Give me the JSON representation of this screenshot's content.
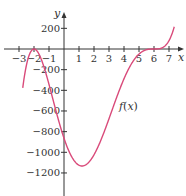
{
  "chart_data": {
    "type": "line",
    "title": "",
    "xlabel": "x",
    "ylabel": "y",
    "xlim": [
      -3.6,
      7.9
    ],
    "ylim": [
      -1420,
      470
    ],
    "x_ticks": [
      -3,
      -2,
      -1,
      1,
      2,
      3,
      4,
      5,
      6,
      7
    ],
    "y_ticks": [
      200,
      -200,
      -400,
      -600,
      -800,
      -1000,
      -1200
    ],
    "grid": false,
    "legend": null,
    "annotations": [
      {
        "text": "f(x)",
        "x": 4.0,
        "y": -560
      }
    ],
    "series": [
      {
        "name": "f(x)",
        "color": "#d94a7a",
        "x": [
          -2.7,
          -2.5,
          -2.0,
          -1.5,
          -1.0,
          0.0,
          1.0,
          1.2,
          2.0,
          3.0,
          4.0,
          5.0,
          5.5,
          6.0,
          6.5,
          7.0,
          7.3
        ],
        "y": [
          -1688,
          -416,
          0,
          -421,
          -1029,
          -864,
          -1125,
          -1132,
          -1024,
          -675,
          -288,
          -49,
          -3,
          0,
          1,
          81,
          226
        ]
      }
    ],
    "key_points": {
      "local_max": [
        -2,
        0
      ],
      "local_min": [
        1.2,
        -1132
      ],
      "y_intercept": [
        0,
        -864
      ],
      "zero_inflection": [
        6,
        0
      ]
    }
  },
  "axes": {
    "x_axis_label": "x",
    "y_axis_label": "y",
    "x_tick_labels": [
      "−3",
      "−2",
      "−1",
      "1",
      "2",
      "3",
      "4",
      "5",
      "6",
      "7"
    ],
    "y_tick_labels": [
      "200",
      "−200",
      "−400",
      "−600",
      "−800",
      "−1000",
      "−1200"
    ]
  },
  "curve_label": {
    "prefix": "f(",
    "var": "x",
    "suffix": ")"
  },
  "colors": {
    "curve": "#d94a7a",
    "axis": "#333333"
  }
}
